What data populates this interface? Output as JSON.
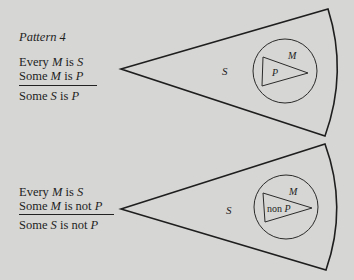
{
  "pattern1": {
    "title": "Pattern 4",
    "premise1": {
      "a": "Every ",
      "m": "M",
      "b": " is ",
      "s": "S"
    },
    "premise2": {
      "a": "Some ",
      "m": "M",
      "b": " is ",
      "p": "P"
    },
    "conclusion": {
      "a": "Some ",
      "s": "S",
      "b": " is ",
      "p": "P"
    },
    "diagram": {
      "outer_label": "S",
      "circle_label": "M",
      "inner_label": "P"
    }
  },
  "pattern2": {
    "premise1": {
      "a": "Every ",
      "m": "M",
      "b": " is ",
      "s": "S"
    },
    "premise2": {
      "a": "Some ",
      "m": "M",
      "b": " is not ",
      "p": "P"
    },
    "conclusion": {
      "a": "Some ",
      "s": "S",
      "b": " is not ",
      "p": "P"
    },
    "diagram": {
      "outer_label": "S",
      "circle_label": "M",
      "inner_label_prefix": "non ",
      "inner_label_var": "P"
    }
  },
  "colors": {
    "background": "#d6d6d4",
    "ink": "#1e1e1e"
  }
}
